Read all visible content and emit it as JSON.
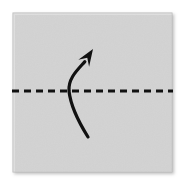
{
  "figure": {
    "title": "Origami valley/mountain fold step",
    "caption": "",
    "background_color": "#ffffff"
  },
  "paper": {
    "name": "square-paper-sheet",
    "fill_color": "#d3d3d3",
    "edge_color": "#bcbcbc",
    "shadow_color": "#c8c8c8",
    "x": 13,
    "y": 13,
    "width": 159,
    "height": 159
  },
  "fold_line": {
    "name": "horizontal-fold-crease",
    "style": "dashed",
    "color": "#111111",
    "stroke_width": 3,
    "dash": "7 5",
    "y": 91,
    "x_start": 12,
    "x_end": 173,
    "orientation": "horizontal",
    "meaning": "fold crease line"
  },
  "fold_arrow": {
    "name": "fold-direction-arrow",
    "color": "#111111",
    "stroke_width": 3.2,
    "meaning": "fold bottom edge up over the crease",
    "tail_x": 88,
    "tail_y": 137,
    "tip_x": 93,
    "tip_y": 49,
    "crosses_crease_at_x": 69,
    "arrowhead": "solid-triangle",
    "arrowhead_angle_deg": 57
  },
  "labels": {
    "step_number": "",
    "note": ""
  }
}
